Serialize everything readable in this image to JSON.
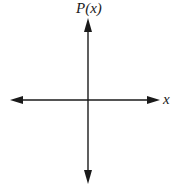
{
  "diagram": {
    "type": "coordinate-axes",
    "y_axis": {
      "label": "P(x)",
      "arrows": [
        "up",
        "down"
      ]
    },
    "x_axis": {
      "label": "x",
      "arrows": [
        "left",
        "right"
      ]
    },
    "colors": {
      "axis": "#1a1a1a",
      "background": "#ffffff"
    }
  }
}
